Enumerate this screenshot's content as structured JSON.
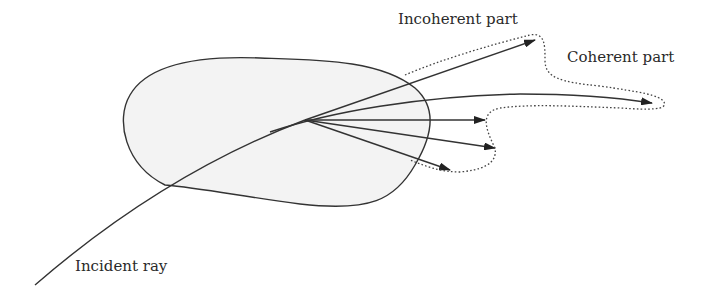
{
  "diagram": {
    "labels": {
      "incoherent": "Incoherent part",
      "coherent": "Coherent part",
      "incident": "Incident ray"
    },
    "colors": {
      "stroke": "#333333",
      "fill": "#f3f3f3",
      "text": "#2a2a2a"
    }
  }
}
